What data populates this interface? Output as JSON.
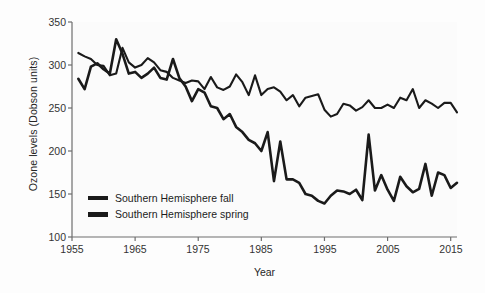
{
  "chart_data": {
    "type": "line",
    "title": "",
    "xlabel": "Year",
    "ylabel": "Ozone levels (Dobson units)",
    "xlim": [
      1955,
      2016
    ],
    "ylim": [
      100,
      350
    ],
    "xticks": [
      1955,
      1965,
      1975,
      1985,
      1995,
      2005,
      2015
    ],
    "yticks": [
      100,
      150,
      200,
      250,
      300,
      350
    ],
    "grid": false,
    "legend_position": "lower-left-inside",
    "line_color": "#1a1a1a",
    "background_color": "#fdfdfd",
    "x": [
      1956,
      1957,
      1958,
      1959,
      1960,
      1961,
      1962,
      1963,
      1964,
      1965,
      1966,
      1967,
      1968,
      1969,
      1970,
      1971,
      1972,
      1973,
      1974,
      1975,
      1976,
      1977,
      1978,
      1979,
      1980,
      1981,
      1982,
      1983,
      1984,
      1985,
      1986,
      1987,
      1988,
      1989,
      1990,
      1991,
      1992,
      1993,
      1994,
      1995,
      1996,
      1997,
      1998,
      1999,
      2000,
      2001,
      2002,
      2003,
      2004,
      2005,
      2006,
      2007,
      2008,
      2009,
      2010,
      2011,
      2012,
      2013,
      2014,
      2015,
      2016
    ],
    "series": [
      {
        "name": "Southern Hemisphere fall",
        "values": [
          314,
          310,
          307,
          300,
          299,
          288,
          290,
          320,
          303,
          297,
          300,
          308,
          303,
          294,
          292,
          285,
          282,
          279,
          282,
          281,
          272,
          286,
          274,
          271,
          275,
          289,
          280,
          265,
          288,
          265,
          272,
          274,
          269,
          259,
          265,
          252,
          262,
          264,
          266,
          248,
          240,
          243,
          255,
          253,
          247,
          251,
          259,
          250,
          250,
          254,
          250,
          262,
          259,
          272,
          250,
          259,
          255,
          250,
          256,
          256,
          245
        ]
      },
      {
        "name": "Southern Hemisphere spring",
        "values": [
          284,
          272,
          298,
          302,
          295,
          290,
          330,
          313,
          290,
          292,
          285,
          290,
          297,
          285,
          283,
          307,
          285,
          275,
          258,
          272,
          268,
          252,
          250,
          237,
          243,
          228,
          222,
          213,
          209,
          200,
          222,
          165,
          211,
          167,
          167,
          163,
          150,
          148,
          142,
          139,
          148,
          154,
          153,
          150,
          155,
          143,
          219,
          154,
          172,
          155,
          142,
          170,
          159,
          152,
          156,
          185,
          148,
          175,
          172,
          157,
          163
        ]
      }
    ]
  },
  "axes": {
    "ytick_labels": [
      "350",
      "300",
      "250",
      "200",
      "150",
      "100"
    ],
    "xtick_labels": [
      "1955",
      "1965",
      "1975",
      "1985",
      "1995",
      "2005",
      "2015"
    ]
  },
  "legend": {
    "items": [
      {
        "label": "Southern Hemisphere fall"
      },
      {
        "label": "Southern Hemisphere spring"
      }
    ]
  }
}
